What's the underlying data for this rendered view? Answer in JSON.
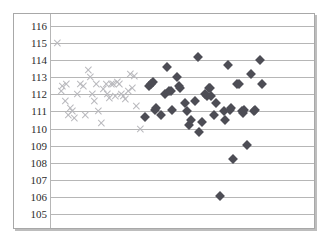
{
  "chart_data": {
    "type": "scatter",
    "title": "",
    "xlabel": "",
    "ylabel": "",
    "ylim": [
      105,
      116
    ],
    "xlim": [
      0,
      100
    ],
    "grid": true,
    "grid_axis": "y",
    "legend": "none",
    "y_ticks": [
      116,
      115,
      114,
      113,
      112,
      111,
      110,
      109,
      108,
      107,
      106,
      105
    ],
    "x_ticks": [],
    "x_tick_labels": [],
    "series": [
      {
        "name": "Series 1",
        "marker": "x",
        "color": "#b9b9bd",
        "points": [
          [
            1.5,
            115.0
          ],
          [
            3.0,
            112.2
          ],
          [
            3.4,
            112.5
          ],
          [
            4.4,
            111.6
          ],
          [
            5.0,
            112.6
          ],
          [
            5.6,
            110.8
          ],
          [
            6.5,
            111.2
          ],
          [
            7.4,
            111.0
          ],
          [
            8.2,
            110.6
          ],
          [
            9.4,
            112.0
          ],
          [
            10.6,
            112.6
          ],
          [
            11.6,
            112.5
          ],
          [
            12.4,
            110.8
          ],
          [
            13.5,
            113.4
          ],
          [
            14.3,
            113.0
          ],
          [
            15.0,
            112.0
          ],
          [
            15.8,
            111.6
          ],
          [
            16.8,
            112.6
          ],
          [
            17.7,
            111.0
          ],
          [
            18.7,
            110.3
          ],
          [
            19.6,
            112.3
          ],
          [
            20.5,
            112.6
          ],
          [
            21.2,
            112.0
          ],
          [
            21.9,
            111.8
          ],
          [
            22.6,
            112.6
          ],
          [
            23.4,
            112.6
          ],
          [
            24.2,
            111.9
          ],
          [
            25.0,
            112.7
          ],
          [
            25.8,
            112.6
          ],
          [
            26.6,
            112.0
          ],
          [
            27.4,
            111.9
          ],
          [
            28.2,
            111.7
          ],
          [
            29.4,
            112.2
          ],
          [
            30.2,
            113.2
          ],
          [
            31.0,
            112.4
          ],
          [
            31.8,
            113.1
          ],
          [
            32.6,
            111.3
          ],
          [
            34.2,
            110.0
          ]
        ]
      },
      {
        "name": "Series 2",
        "marker": "diamond",
        "color": "#4d4d55",
        "points": [
          [
            36.0,
            110.7
          ],
          [
            37.4,
            112.5
          ],
          [
            38.2,
            112.6
          ],
          [
            38.9,
            112.7
          ],
          [
            39.6,
            111.1
          ],
          [
            40.2,
            111.2
          ],
          [
            42.0,
            110.8
          ],
          [
            43.6,
            112.0
          ],
          [
            44.4,
            113.6
          ],
          [
            45.4,
            112.2
          ],
          [
            46.1,
            112.2
          ],
          [
            46.5,
            111.1
          ],
          [
            48.6,
            113.0
          ],
          [
            49.2,
            112.5
          ],
          [
            49.6,
            112.4
          ],
          [
            51.6,
            111.5
          ],
          [
            52.4,
            111.0
          ],
          [
            53.0,
            110.2
          ],
          [
            54.0,
            110.5
          ],
          [
            55.4,
            111.6
          ],
          [
            56.6,
            114.2
          ],
          [
            57.2,
            109.8
          ],
          [
            58.2,
            110.4
          ],
          [
            59.6,
            112.0
          ],
          [
            60.2,
            111.9
          ],
          [
            61.0,
            112.4
          ],
          [
            61.5,
            112.4
          ],
          [
            62.0,
            111.9
          ],
          [
            63.0,
            110.8
          ],
          [
            63.8,
            111.5
          ],
          [
            65.2,
            106.05
          ],
          [
            66.8,
            111.0
          ],
          [
            67.4,
            110.5
          ],
          [
            68.4,
            113.7
          ],
          [
            69.2,
            111.1
          ],
          [
            69.8,
            111.2
          ],
          [
            70.4,
            108.2
          ],
          [
            72.0,
            112.6
          ],
          [
            72.8,
            112.6
          ],
          [
            74.0,
            111.0
          ],
          [
            74.4,
            110.9
          ],
          [
            74.8,
            111.1
          ],
          [
            76.0,
            109.05
          ],
          [
            77.4,
            113.2
          ],
          [
            78.6,
            111.0
          ],
          [
            79.2,
            111.1
          ],
          [
            81.0,
            114.0
          ],
          [
            82.0,
            112.6
          ]
        ]
      }
    ]
  }
}
